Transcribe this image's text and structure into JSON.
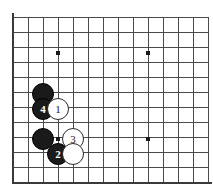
{
  "figure": {
    "board": {
      "background_color": "#ffffff",
      "line_color": "#4a4a4a",
      "border_color": "#3a3a3a",
      "origin_x": 13,
      "origin_y": 17,
      "spacing": 15,
      "cols": 13,
      "rows": 11,
      "border_left": true,
      "border_bottom": true,
      "star_points": [
        {
          "col": 3,
          "row": 2.4
        },
        {
          "col": 9,
          "row": 2.4
        },
        {
          "col": 3,
          "row": 8.13
        },
        {
          "col": 9,
          "row": 8.13
        }
      ]
    },
    "stones": [
      {
        "id": "black-stone-upper",
        "color": "black",
        "label": "",
        "x": 43,
        "y": 94,
        "r": 11
      },
      {
        "id": "black-stone-move-4",
        "color": "black",
        "label": "4",
        "x": 43,
        "y": 109,
        "r": 11
      },
      {
        "id": "white-stone-move-1",
        "color": "white",
        "label": "1",
        "x": 58,
        "y": 109,
        "r": 11
      },
      {
        "id": "black-stone-lower",
        "color": "black",
        "label": "",
        "x": 43,
        "y": 139,
        "r": 11
      },
      {
        "id": "white-stone-move-3",
        "color": "white",
        "label": "3",
        "x": 73,
        "y": 139,
        "r": 11
      },
      {
        "id": "black-stone-move-2",
        "color": "black",
        "label": "2",
        "x": 58,
        "y": 154,
        "r": 11
      },
      {
        "id": "white-stone-plain",
        "color": "white",
        "label": "",
        "x": 73,
        "y": 154,
        "r": 11
      }
    ],
    "colors": {
      "black_stone": "#1a1a1a",
      "white_stone": "#ffffff",
      "stone_outline": "#2b2b2b",
      "grid": "#4a4a4a",
      "star_point": "#1a1a1a"
    }
  }
}
